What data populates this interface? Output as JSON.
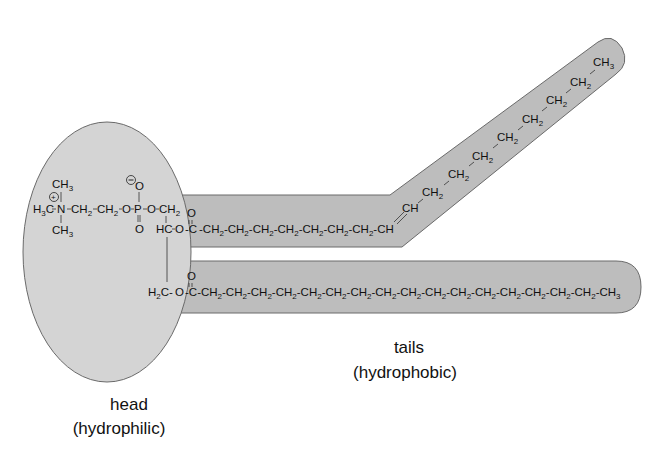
{
  "colors": {
    "head_fill": "#d4d4d4",
    "tail_fill": "#bdbdbd",
    "outline": "#6a6a6a",
    "text": "#111111",
    "background": "#ffffff"
  },
  "labels": {
    "head": "head",
    "head_sub": "(hydrophilic)",
    "tails": "tails",
    "tails_sub": "(hydrophobic)"
  },
  "head_group": {
    "choline_methyl_top": "CH3",
    "choline_methyl_left": "H3C",
    "choline_methyl_bottom": "CH3",
    "nitrogen": "N",
    "nitrogen_charge": "+",
    "ethylene_1": "CH2",
    "ethylene_2": "CH2",
    "ester_o1": "O",
    "phosphorus": "P",
    "phosphate_o_top": "O",
    "phosphate_o_top_charge": "−",
    "phosphate_o_bottom": "O",
    "ester_o2": "O",
    "glycerol_c1": "CH2",
    "glycerol_c2": "HC",
    "glycerol_c3": "H2C",
    "glycerol_o2": "O",
    "glycerol_o3": "O"
  },
  "upper_tail": {
    "carbonyl_o": "O",
    "carbonyl_c": "C",
    "saturated_segment": [
      "CH2",
      "CH2",
      "CH2",
      "CH2",
      "CH2",
      "CH2",
      "CH2"
    ],
    "double_bond": [
      "CH",
      "CH"
    ],
    "diagonal_segment": [
      "CH2",
      "CH2",
      "CH2",
      "CH2",
      "CH2",
      "CH2",
      "CH2"
    ],
    "terminal": "CH3"
  },
  "lower_tail": {
    "carbonyl_o": "O",
    "carbonyl_c": "C",
    "segment": [
      "CH2",
      "CH2",
      "CH2",
      "CH2",
      "CH2",
      "CH2",
      "CH2",
      "CH2",
      "CH2",
      "CH2",
      "CH2",
      "CH2",
      "CH2",
      "CH2",
      "CH2",
      "CH2"
    ],
    "terminal": "CH3"
  }
}
